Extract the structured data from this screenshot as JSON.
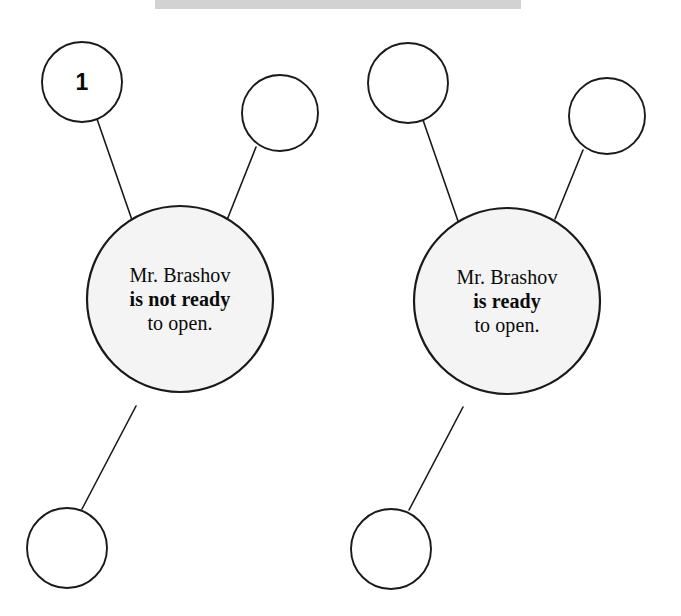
{
  "page": {
    "background_color": "#ffffff",
    "ink_color": "#1a1a1a",
    "bubble_fill_color": "#f4f4f4",
    "header_bar_color": "#d2d2d2",
    "width": 681,
    "height": 616
  },
  "diagrams": [
    {
      "id": "left",
      "center_bubble": {
        "lines": [
          {
            "text": "Mr. Brashov",
            "bold": false
          },
          {
            "text": "is not ready",
            "bold": true
          },
          {
            "text": "to open.",
            "bold": false
          }
        ],
        "cx": 180,
        "cy": 299,
        "r": 93
      },
      "satellites": [
        {
          "name": "satellite-1",
          "label": "1",
          "cx": 82,
          "cy": 82,
          "r": 40
        },
        {
          "name": "satellite-2",
          "label": "",
          "cx": 280,
          "cy": 113,
          "r": 38
        },
        {
          "name": "satellite-3",
          "label": "",
          "cx": 67,
          "cy": 548,
          "r": 40
        }
      ],
      "connectors": [
        {
          "x1": 97,
          "y1": 119,
          "x2": 132,
          "y2": 220
        },
        {
          "x1": 256,
          "y1": 147,
          "x2": 227,
          "y2": 220
        },
        {
          "x1": 136,
          "y1": 406,
          "x2": 82,
          "y2": 509
        }
      ]
    },
    {
      "id": "right",
      "center_bubble": {
        "lines": [
          {
            "text": "Mr. Brashov",
            "bold": false
          },
          {
            "text": "is ready",
            "bold": true
          },
          {
            "text": "to open.",
            "bold": false
          }
        ],
        "cx": 507,
        "cy": 301,
        "r": 93
      },
      "satellites": [
        {
          "name": "satellite-1",
          "label": "",
          "cx": 408,
          "cy": 83,
          "r": 40
        },
        {
          "name": "satellite-2",
          "label": "",
          "cx": 607,
          "cy": 116,
          "r": 38
        },
        {
          "name": "satellite-3",
          "label": "",
          "cx": 391,
          "cy": 549,
          "r": 40
        }
      ],
      "connectors": [
        {
          "x1": 423,
          "y1": 120,
          "x2": 458,
          "y2": 221
        },
        {
          "x1": 583,
          "y1": 150,
          "x2": 555,
          "y2": 219
        },
        {
          "x1": 463,
          "y1": 407,
          "x2": 409,
          "y2": 510
        }
      ]
    }
  ]
}
